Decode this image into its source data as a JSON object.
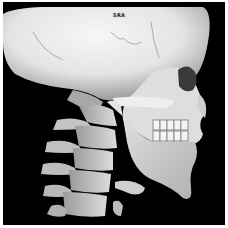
{
  "image": {
    "description": "3D CT volume rendering of skull and cervical spine, left lateral view",
    "orientation_label": "SRA",
    "colors": {
      "background": "#000000",
      "bone_light": "#f2f2f2",
      "bone_mid": "#c8c8c8",
      "bone_shadow": "#8a8a8a",
      "border": "#ffffff"
    }
  }
}
